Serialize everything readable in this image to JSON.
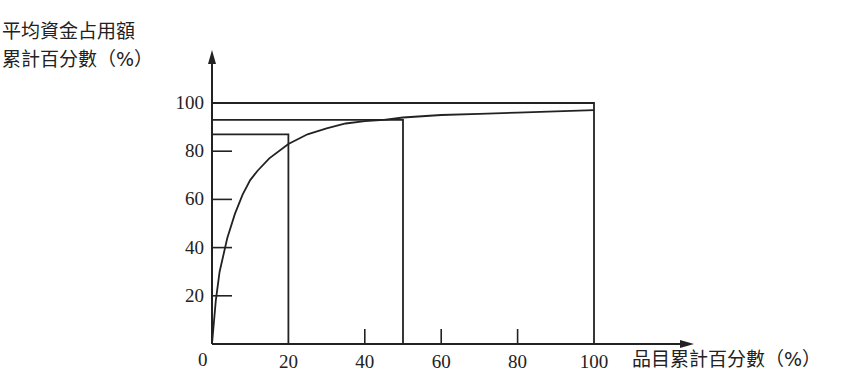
{
  "chart_data": {
    "type": "line",
    "title": "",
    "ylabel_line1": "平均資金占用額",
    "ylabel_line2": "累計百分數（%）",
    "xlabel": "品目累計百分數（%）",
    "origin_label": "0",
    "x_ticks": [
      "20",
      "40",
      "60",
      "80",
      "100"
    ],
    "y_ticks": [
      "20",
      "40",
      "60",
      "80",
      "100"
    ],
    "xlim": [
      0,
      100
    ],
    "ylim": [
      0,
      100
    ],
    "grid": false,
    "series": [
      {
        "name": "累計曲線",
        "x": [
          0,
          1,
          2,
          4,
          6,
          8,
          10,
          12,
          15,
          20,
          25,
          30,
          35,
          40,
          45,
          50,
          60,
          70,
          80,
          90,
          100
        ],
        "y": [
          0,
          18,
          30,
          44,
          54,
          62,
          68,
          72,
          77,
          83,
          87,
          89.5,
          91.5,
          92.5,
          93,
          94,
          95,
          95.5,
          96,
          96.5,
          97
        ]
      }
    ],
    "reference_lines": [
      {
        "x": 20,
        "y": 87,
        "description": "A類: 20% 品目 ≈ 87% 資金"
      },
      {
        "x": 50,
        "y": 93,
        "description": "B類: 50% 品目 ≈ 93% 資金"
      },
      {
        "x": 100,
        "y": 100,
        "description": "全部: 100% 品目 = 100% 資金"
      }
    ]
  }
}
